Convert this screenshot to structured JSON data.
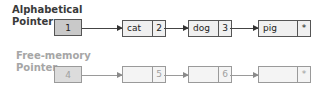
{
  "alphabetical": {
    "label_line1": "Alphabetical",
    "label_line2": "Pointer",
    "pointer_value": "1",
    "nodes": [
      {
        "data": "cat",
        "next": "2"
      },
      {
        "data": "dog",
        "next": "3"
      },
      {
        "data": "pig",
        "next": "*"
      }
    ]
  },
  "free_memory": {
    "label_line1": "Free-memory",
    "label_line2": "Pointer",
    "pointer_value": "4",
    "nodes": [
      {
        "data": "",
        "next": "5"
      },
      {
        "data": "",
        "next": "6"
      },
      {
        "data": "",
        "next": "*"
      }
    ]
  },
  "colors": {
    "dark_border": "#555555",
    "faded_border": "#9a9a9a",
    "pointer_fill": "#c9c9c9",
    "node_fill": "#f0f0f0"
  }
}
